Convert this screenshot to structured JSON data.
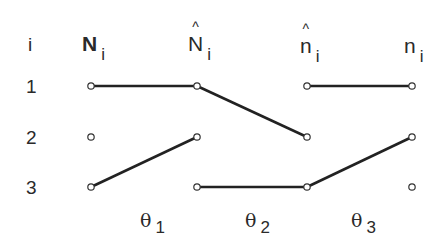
{
  "header": {
    "index_label": "i",
    "columns": [
      {
        "symbol": "N",
        "subscript": "i",
        "hat": false,
        "bold": true
      },
      {
        "symbol": "N",
        "subscript": "i",
        "hat": true,
        "bold": false
      },
      {
        "symbol": "n",
        "subscript": "i",
        "hat": true,
        "bold": false
      },
      {
        "symbol": "n",
        "subscript": "i",
        "hat": false,
        "bold": false
      }
    ]
  },
  "rows": [
    "1",
    "2",
    "3"
  ],
  "transitions": [
    {
      "symbol": "θ",
      "subscript": "1"
    },
    {
      "symbol": "θ",
      "subscript": "2"
    },
    {
      "symbol": "θ",
      "subscript": "3"
    }
  ],
  "edges": [
    {
      "from": {
        "col": 0,
        "row": 0
      },
      "to": {
        "col": 1,
        "row": 0
      }
    },
    {
      "from": {
        "col": 0,
        "row": 2
      },
      "to": {
        "col": 1,
        "row": 1
      }
    },
    {
      "from": {
        "col": 1,
        "row": 0
      },
      "to": {
        "col": 2,
        "row": 1
      }
    },
    {
      "from": {
        "col": 1,
        "row": 2
      },
      "to": {
        "col": 2,
        "row": 2
      }
    },
    {
      "from": {
        "col": 2,
        "row": 0
      },
      "to": {
        "col": 3,
        "row": 0
      }
    },
    {
      "from": {
        "col": 2,
        "row": 2
      },
      "to": {
        "col": 3,
        "row": 1
      }
    }
  ],
  "style": {
    "line_color": "#222222",
    "node_fill": "#ffffff"
  }
}
